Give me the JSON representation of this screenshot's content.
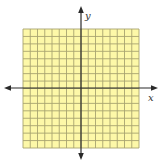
{
  "figure": {
    "type": "coordinate-grid",
    "background": "#ffffff",
    "grid": {
      "fill": "#fdf8a8",
      "line_color": "#a8a470",
      "cols": 16,
      "rows": 16,
      "x": 23,
      "y": 29,
      "width": 116,
      "height": 119
    },
    "axes": {
      "color": "#2a2a2a",
      "origin_x": 81,
      "origin_y": 88,
      "x_axis": {
        "from": 4,
        "to": 158,
        "label": "x"
      },
      "y_axis": {
        "from": 6,
        "to": 160,
        "label": "y"
      }
    }
  }
}
